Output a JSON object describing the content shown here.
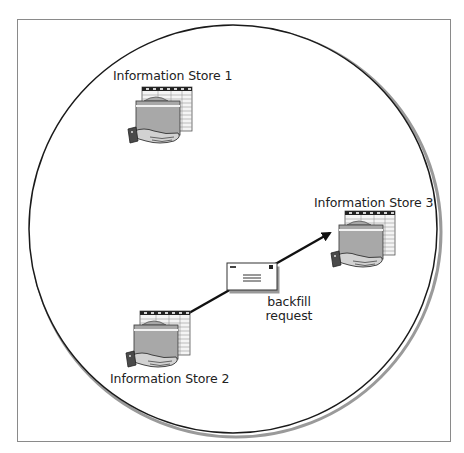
{
  "diagram": {
    "type": "topology",
    "colors": {
      "frame": "#8a8a8a",
      "circle": "#1a1a1a",
      "circle_shadow": "#9a9a9a",
      "folder": "#a8a8a8",
      "sheet": "#f2f2f2",
      "hand": "#c8c8c8",
      "cuff": "#4a4a4a",
      "text": "#222222"
    },
    "nodes": [
      {
        "id": "store1",
        "label": "Information Store 1",
        "icon": "hand-holding-folder-icon"
      },
      {
        "id": "store2",
        "label": "Information Store 2",
        "icon": "hand-holding-folder-icon"
      },
      {
        "id": "store3",
        "label": "Information Store 3",
        "icon": "hand-holding-folder-icon"
      }
    ],
    "message": {
      "icon": "envelope-icon",
      "label_line1": "backfill",
      "label_line2": "request"
    },
    "edges": [
      {
        "from": "store2",
        "to": "store3",
        "label": "backfill request",
        "arrow": "end"
      }
    ]
  }
}
